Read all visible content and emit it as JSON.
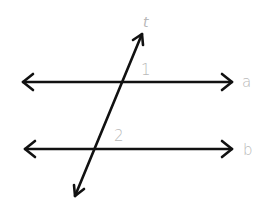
{
  "diagram": {
    "line_color": "#111111",
    "label_color": "#b8b8b8",
    "lines": [
      {
        "name": "a",
        "label": "a",
        "from": [
          23,
          82
        ],
        "to": [
          232,
          82
        ]
      },
      {
        "name": "b",
        "label": "b",
        "from": [
          25,
          149
        ],
        "to": [
          232,
          149
        ]
      },
      {
        "name": "t",
        "label": "t",
        "from": [
          75,
          196
        ],
        "to": [
          142,
          34
        ]
      }
    ],
    "angles": [
      {
        "label": "1",
        "position": [
          144,
          75
        ]
      },
      {
        "label": "2",
        "position": [
          120,
          141
        ]
      }
    ]
  }
}
